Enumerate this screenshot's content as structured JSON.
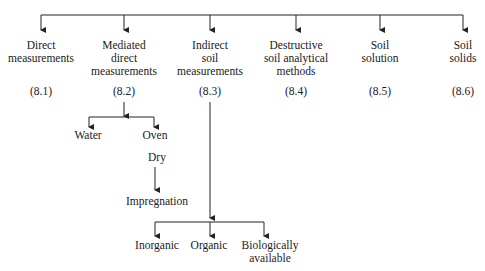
{
  "diagram": {
    "type": "tree",
    "root_children": [
      {
        "label_lines": [
          "Direct",
          "measurements"
        ],
        "ref": "(8.1)"
      },
      {
        "label_lines": [
          "Mediated",
          "direct",
          "measurements"
        ],
        "ref": "(8.2)"
      },
      {
        "label_lines": [
          "Indirect",
          "soil",
          "measurements"
        ],
        "ref": "(8.3)"
      },
      {
        "label_lines": [
          "Destructive",
          "soil analytical",
          "methods"
        ],
        "ref": "(8.4)"
      },
      {
        "label_lines": [
          "Soil",
          "solution"
        ],
        "ref": "(8.5)"
      },
      {
        "label_lines": [
          "Soil",
          "solids"
        ],
        "ref": "(8.6)"
      }
    ],
    "mediated_children": [
      "Water",
      "Oven"
    ],
    "oven_sub": "Dry",
    "dry_child": "Impregnation",
    "indirect_children": [
      {
        "label_lines": [
          "Inorganic"
        ]
      },
      {
        "label_lines": [
          "Organic"
        ]
      },
      {
        "label_lines": [
          "Biologically",
          "available"
        ]
      }
    ],
    "line_color": "#222222"
  }
}
